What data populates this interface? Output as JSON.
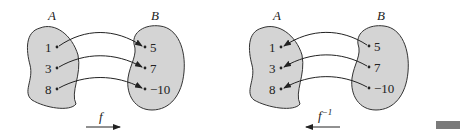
{
  "diagrams": [
    {
      "name": "f",
      "set_a_label": "A",
      "set_b_label": "B",
      "domain_values": [
        "1",
        "3",
        "8"
      ],
      "range_values": [
        "5",
        "7",
        "−10"
      ],
      "function_label": "f",
      "function_superscript": "",
      "arrow_direction": "right"
    },
    {
      "name": "f-inverse",
      "set_a_label": "A",
      "set_b_label": "B",
      "domain_values": [
        "1",
        "3",
        "8"
      ],
      "range_values": [
        "5",
        "7",
        "−10"
      ],
      "function_label": "f",
      "function_superscript": "−1",
      "arrow_direction": "left"
    }
  ],
  "colors": {
    "blob_fill": "#d4d4d4",
    "stroke": "#222222",
    "marker": "#7a7a7a"
  }
}
